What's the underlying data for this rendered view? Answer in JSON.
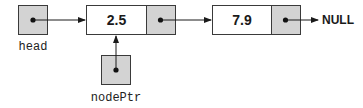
{
  "diagram": {
    "type": "linked-list",
    "head_label": "head",
    "node_pointer_label": "nodePtr",
    "null_label": "NULL",
    "nodes": [
      {
        "value": "2.5"
      },
      {
        "value": "7.9"
      }
    ],
    "colors": {
      "pointer_fill": "#d3d3d3",
      "data_fill": "#ffffff",
      "stroke": "#3a3a3a"
    }
  }
}
